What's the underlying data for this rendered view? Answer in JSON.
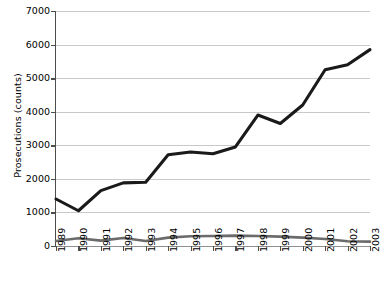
{
  "chart_data": {
    "type": "line",
    "title": "",
    "xlabel": "",
    "ylabel": "Prosecutions (counts)",
    "ylim": [
      0,
      7000
    ],
    "ytick_values": [
      0,
      1000,
      2000,
      3000,
      4000,
      5000,
      6000,
      7000
    ],
    "ytick_labels": [
      "0",
      "1000",
      "2000",
      "3000",
      "4000",
      "5000",
      "6000",
      "7000"
    ],
    "grid": true,
    "legend": "none",
    "categories": [
      "1989",
      "1990",
      "1991",
      "1992",
      "1993",
      "1994",
      "1995",
      "1996",
      "1997",
      "1998",
      "1999",
      "2000",
      "2001",
      "2002",
      "2003"
    ],
    "series": [
      {
        "name": "Prosecutions (total)",
        "color": "#1a1a1a",
        "values": [
          1400,
          1050,
          1650,
          1880,
          1900,
          2720,
          2800,
          2750,
          2950,
          3900,
          3650,
          4200,
          5250,
          5400,
          5850
        ]
      },
      {
        "name": "Prosecutions (secondary)",
        "color": "#6b6b6b",
        "values": [
          150,
          230,
          160,
          240,
          150,
          250,
          290,
          300,
          310,
          300,
          280,
          250,
          210,
          140,
          130
        ]
      }
    ]
  }
}
